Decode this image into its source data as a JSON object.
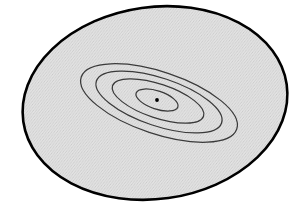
{
  "figure": {
    "type": "line-art-diagram",
    "canvas": {
      "width": 308,
      "height": 215,
      "background": "#ffffff"
    },
    "colors": {
      "background": "#ffffff",
      "region_fill": "#dcdcdc",
      "region_stroke": "#000000",
      "contour_stroke": "#3a3a3a",
      "center_dot": "#000000"
    },
    "region": {
      "name": "outer-region-ellipse",
      "cx": 155,
      "cy": 103,
      "rx": 133,
      "ry": 96,
      "rotation_deg": -8,
      "stroke_width": 2.6,
      "fill": "#dcdcdc",
      "fill_pattern": "halftone-dither"
    },
    "contours": [
      {
        "name": "contour-ring-1",
        "level": 1,
        "cx": 159,
        "cy": 103,
        "rx": 82,
        "ry": 31,
        "rotation_deg": 18.5,
        "stroke_width": 1.25
      },
      {
        "name": "contour-ring-2",
        "level": 2,
        "cx": 159,
        "cy": 102,
        "rx": 66,
        "ry": 24,
        "rotation_deg": 18.5,
        "stroke_width": 1.25
      },
      {
        "name": "contour-ring-3",
        "level": 3,
        "cx": 158,
        "cy": 101,
        "rx": 48,
        "ry": 17,
        "rotation_deg": 18.5,
        "stroke_width": 1.25
      },
      {
        "name": "contour-ring-4",
        "level": 4,
        "cx": 157,
        "cy": 100,
        "rx": 22,
        "ry": 9,
        "rotation_deg": 18.5,
        "stroke_width": 1.25
      }
    ],
    "center_point": {
      "name": "center-point",
      "cx": 157,
      "cy": 100,
      "r": 1.9
    },
    "labels": []
  }
}
